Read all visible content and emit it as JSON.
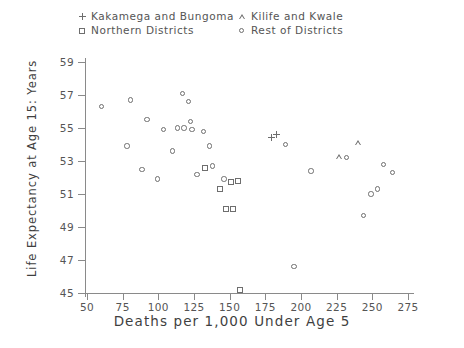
{
  "chart_data": {
    "type": "scatter",
    "title": "",
    "xlabel": "Deaths per 1,000 Under Age 5",
    "ylabel": "Life Expectancy at Age 15: Years",
    "xlim": [
      50,
      275
    ],
    "ylim": [
      45,
      59
    ],
    "xticks": [
      50,
      75,
      100,
      125,
      150,
      175,
      200,
      225,
      250,
      275
    ],
    "yticks": [
      45,
      47,
      49,
      51,
      53,
      55,
      57,
      59
    ],
    "grid": false,
    "legend_position": "top",
    "series": [
      {
        "name": "Kakamega and Bungoma",
        "marker": "plus",
        "color": "#6e6e6e",
        "points": [
          [
            179.5,
            54.4
          ],
          [
            182.5,
            54.6
          ]
        ]
      },
      {
        "name": "Northern Districts",
        "marker": "square",
        "color": "#6e6e6e",
        "points": [
          [
            133.0,
            52.6
          ],
          [
            147.5,
            50.1
          ],
          [
            152.0,
            50.1
          ],
          [
            143.5,
            51.3
          ],
          [
            155.5,
            51.8
          ],
          [
            151.0,
            51.7
          ],
          [
            157.5,
            45.2
          ]
        ]
      },
      {
        "name": "Kilife and Kwale",
        "marker": "triangle",
        "color": "#6e6e6e",
        "points": [
          [
            227.0,
            53.3
          ],
          [
            240.0,
            54.1
          ]
        ]
      },
      {
        "name": "Rest of Districts",
        "marker": "circle",
        "color": "#6e6e6e",
        "points": [
          [
            60.0,
            56.3
          ],
          [
            78.0,
            53.9
          ],
          [
            80.5,
            56.7
          ],
          [
            92.0,
            55.5
          ],
          [
            88.5,
            52.5
          ],
          [
            99.5,
            51.9
          ],
          [
            103.5,
            54.9
          ],
          [
            110.0,
            53.6
          ],
          [
            113.5,
            55.0
          ],
          [
            118.0,
            55.0
          ],
          [
            117.0,
            57.1
          ],
          [
            121.0,
            56.6
          ],
          [
            122.5,
            55.4
          ],
          [
            123.5,
            54.9
          ],
          [
            131.5,
            54.8
          ],
          [
            127.0,
            52.2
          ],
          [
            136.0,
            53.9
          ],
          [
            138.0,
            52.7
          ],
          [
            146.0,
            51.9
          ],
          [
            189.0,
            54.0
          ],
          [
            195.0,
            46.6
          ],
          [
            207.0,
            52.4
          ],
          [
            232.0,
            53.2
          ],
          [
            244.0,
            49.7
          ],
          [
            249.0,
            51.0
          ],
          [
            253.5,
            51.3
          ],
          [
            258.0,
            52.8
          ],
          [
            264.0,
            52.3
          ]
        ]
      }
    ]
  },
  "legend": {
    "entries": [
      {
        "id": "plus",
        "marker": "plus-marker-icon",
        "label": "Kakamega and Bungoma"
      },
      {
        "id": "square",
        "marker": "square-marker-icon",
        "label": "Northern Districts"
      },
      {
        "id": "tri",
        "marker": "triangle-marker-icon",
        "label": "Kilife and Kwale"
      },
      {
        "id": "circle",
        "marker": "circle-marker-icon",
        "label": "Rest of Districts"
      }
    ]
  }
}
